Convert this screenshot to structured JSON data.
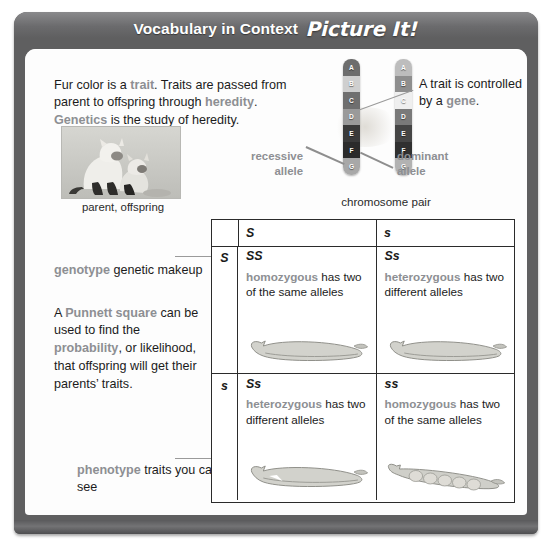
{
  "banner": {
    "title": "Vocabulary in Context",
    "kicker": "Picture It!"
  },
  "intro": {
    "part1": "Fur color is a ",
    "term1": "trait",
    "part2": ". Traits are passed from parent to offspring through ",
    "term2": "heredity",
    "part3": ". ",
    "term3": "Genetics",
    "part4": " is the study of heredity."
  },
  "photo": {
    "caption": "parent, offspring",
    "alt_name": "cat-parent-and-kitten-photo"
  },
  "chromosomes": {
    "caption": "chromosome pair",
    "left_bands": [
      "A",
      "B",
      "C",
      "D",
      "E",
      "F",
      "G"
    ],
    "right_bands": [
      "A",
      "B",
      "C",
      "D",
      "E",
      "F",
      "G"
    ],
    "recessive_label_line1": "recessive",
    "recessive_label_line2": "allele",
    "dominant_label_line1": "dominant",
    "dominant_label_line2": "allele"
  },
  "gene_note": {
    "part1": "A trait is controlled by a ",
    "term": "gene",
    "part2": "."
  },
  "genotype_note": {
    "term": "genotype",
    "rest": " genetic makeup"
  },
  "punnett_note": {
    "part1": "A ",
    "term1": "Punnett square",
    "part2": " can be used to find the ",
    "term2": "probability",
    "part3": ", or likelihood, that offspring will get their parents’ traits."
  },
  "phenotype_note": {
    "term": "phenotype",
    "rest": " traits you can see"
  },
  "punnett_table": {
    "corner": "",
    "col_headers": [
      "S",
      "s"
    ],
    "row_headers": [
      "S",
      "s"
    ],
    "cells": [
      {
        "genotype": "SS",
        "term": "homozygous",
        "desc": " has two of the same alleles",
        "pod": "smooth-pea-pod"
      },
      {
        "genotype": "Ss",
        "term": "heterozygous",
        "desc": " has two different alleles",
        "pod": "smooth-pea-pod"
      },
      {
        "genotype": "Ss",
        "term": "heterozygous",
        "desc": " has two different alleles",
        "pod": "smooth-pea-pod"
      },
      {
        "genotype": "ss",
        "term": "homozygous",
        "desc": " has two of the same alleles",
        "pod": "wrinkled-pea-pod"
      }
    ]
  },
  "colors": {
    "frame": "#5f5f60",
    "banner_text": "#ffffff",
    "vocab_term": "#8d8f93",
    "body_text": "#1b1b1b",
    "table_border": "#2b2b2b"
  }
}
